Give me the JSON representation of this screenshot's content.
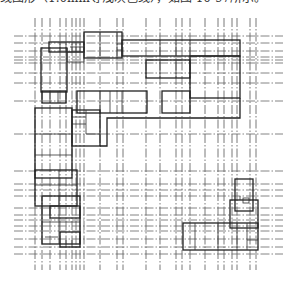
{
  "caption": "线图形（1.0mm等浅灰色线），如图 10-97所示。",
  "diagram": {
    "type": "architectural-floor-plan",
    "axis_line_style": "dash-dot",
    "colors": {
      "axis": "#555555",
      "wall": "#222222",
      "background": "#ffffff"
    }
  }
}
